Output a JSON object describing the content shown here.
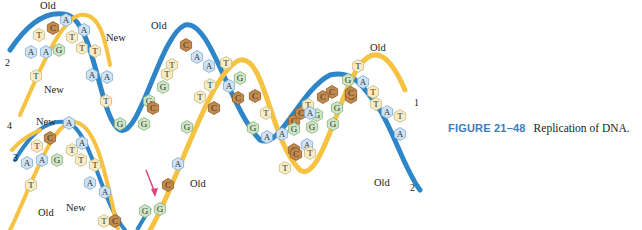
{
  "figure": {
    "title": "Replication of DNA",
    "labels": {
      "old_top_left": "Old",
      "new_top": "New",
      "new_left": "New",
      "old_mid_top": "Old",
      "old_top_right": "Old",
      "old_bottom_right": "Old",
      "new_lower_left": "New",
      "old_lower_left": "Old",
      "new_lower_mid": "New",
      "old_center": "Old"
    },
    "strand_numbers": {
      "n1": "1",
      "n2_left": "2",
      "n2_right": "2",
      "n3": "3",
      "n4": "4"
    },
    "colors": {
      "old_strand": "#2e86c9",
      "new_strand": "#f5c242",
      "adenine": "#cfe3f4",
      "thymine": "#f6ecc6",
      "guanine": "#cfe6c6",
      "cytosine": "#c48a4c",
      "arrow": "#d9457a"
    },
    "bases": [
      {
        "l": "A",
        "x": 66,
        "y": 20
      },
      {
        "l": "C",
        "x": 53,
        "y": 28
      },
      {
        "l": "T",
        "x": 39,
        "y": 35
      },
      {
        "l": "A",
        "x": 84,
        "y": 30
      },
      {
        "l": "T",
        "x": 72,
        "y": 37
      },
      {
        "l": "A",
        "x": 31,
        "y": 52
      },
      {
        "l": "A",
        "x": 46,
        "y": 52
      },
      {
        "l": "G",
        "x": 59,
        "y": 50
      },
      {
        "l": "T",
        "x": 82,
        "y": 48
      },
      {
        "l": "T",
        "x": 95,
        "y": 51
      },
      {
        "l": "T",
        "x": 36,
        "y": 76
      },
      {
        "l": "A",
        "x": 92,
        "y": 75
      },
      {
        "l": "A",
        "x": 107,
        "y": 77
      },
      {
        "l": "T",
        "x": 106,
        "y": 101
      },
      {
        "l": "C",
        "x": 186,
        "y": 45
      },
      {
        "l": "T",
        "x": 172,
        "y": 65
      },
      {
        "l": "A",
        "x": 197,
        "y": 57
      },
      {
        "l": "A",
        "x": 209,
        "y": 66
      },
      {
        "l": "T",
        "x": 226,
        "y": 63
      },
      {
        "l": "T",
        "x": 210,
        "y": 85
      },
      {
        "l": "G",
        "x": 240,
        "y": 78
      },
      {
        "l": "A",
        "x": 229,
        "y": 86
      },
      {
        "l": "T",
        "x": 200,
        "y": 97
      },
      {
        "l": "C",
        "x": 238,
        "y": 98
      },
      {
        "l": "C",
        "x": 255,
        "y": 96
      },
      {
        "l": "G",
        "x": 163,
        "y": 87
      },
      {
        "l": "T",
        "x": 167,
        "y": 74
      },
      {
        "l": "G",
        "x": 149,
        "y": 101
      },
      {
        "l": "C",
        "x": 153,
        "y": 108
      },
      {
        "l": "C",
        "x": 214,
        "y": 108
      },
      {
        "l": "G",
        "x": 120,
        "y": 124
      },
      {
        "l": "G",
        "x": 144,
        "y": 124
      },
      {
        "l": "G",
        "x": 187,
        "y": 127
      },
      {
        "l": "T",
        "x": 266,
        "y": 113
      },
      {
        "l": "G",
        "x": 253,
        "y": 128
      },
      {
        "l": "A",
        "x": 267,
        "y": 137
      },
      {
        "l": "A",
        "x": 282,
        "y": 134
      },
      {
        "l": "C",
        "x": 294,
        "y": 121
      },
      {
        "l": "T",
        "x": 285,
        "y": 168
      },
      {
        "l": "G",
        "x": 294,
        "y": 129
      },
      {
        "l": "C",
        "x": 301,
        "y": 113
      },
      {
        "l": "T",
        "x": 308,
        "y": 105
      },
      {
        "l": "C",
        "x": 332,
        "y": 92
      },
      {
        "l": "C",
        "x": 323,
        "y": 97
      },
      {
        "l": "G",
        "x": 317,
        "y": 115
      },
      {
        "l": "G",
        "x": 312,
        "y": 127
      },
      {
        "l": "A",
        "x": 307,
        "y": 145
      },
      {
        "l": "C",
        "x": 294,
        "y": 150
      },
      {
        "l": "T",
        "x": 310,
        "y": 153
      },
      {
        "l": "G",
        "x": 348,
        "y": 80
      },
      {
        "l": "T",
        "x": 358,
        "y": 66
      },
      {
        "l": "C",
        "x": 351,
        "y": 97
      },
      {
        "l": "G",
        "x": 337,
        "y": 108
      },
      {
        "l": "C",
        "x": 351,
        "y": 93
      },
      {
        "l": "A",
        "x": 363,
        "y": 82
      },
      {
        "l": "T",
        "x": 373,
        "y": 92
      },
      {
        "l": "T",
        "x": 376,
        "y": 104
      },
      {
        "l": "A",
        "x": 387,
        "y": 112
      },
      {
        "l": "T",
        "x": 400,
        "y": 116
      },
      {
        "l": "A",
        "x": 400,
        "y": 134
      },
      {
        "l": "G",
        "x": 333,
        "y": 124
      },
      {
        "l": "A",
        "x": 310,
        "y": 113
      },
      {
        "l": "C",
        "x": 296,
        "y": 154
      },
      {
        "l": "A",
        "x": 69,
        "y": 123
      },
      {
        "l": "C",
        "x": 50,
        "y": 138
      },
      {
        "l": "T",
        "x": 37,
        "y": 146
      },
      {
        "l": "A",
        "x": 82,
        "y": 143
      },
      {
        "l": "T",
        "x": 72,
        "y": 150
      },
      {
        "l": "A",
        "x": 27,
        "y": 163
      },
      {
        "l": "A",
        "x": 42,
        "y": 160
      },
      {
        "l": "G",
        "x": 57,
        "y": 160
      },
      {
        "l": "T",
        "x": 81,
        "y": 160
      },
      {
        "l": "T",
        "x": 95,
        "y": 165
      },
      {
        "l": "T",
        "x": 31,
        "y": 185
      },
      {
        "l": "A",
        "x": 90,
        "y": 183
      },
      {
        "l": "A",
        "x": 105,
        "y": 192
      },
      {
        "l": "T",
        "x": 104,
        "y": 221
      },
      {
        "l": "C",
        "x": 115,
        "y": 221
      },
      {
        "l": "A",
        "x": 178,
        "y": 164
      },
      {
        "l": "C",
        "x": 168,
        "y": 185
      },
      {
        "l": "G",
        "x": 145,
        "y": 211
      },
      {
        "l": "G",
        "x": 160,
        "y": 209
      }
    ]
  }
}
